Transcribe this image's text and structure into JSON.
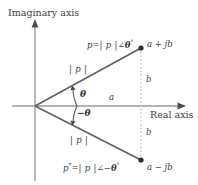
{
  "figure": {
    "background_color": "#ffffff",
    "line_color": "#6e6e6e",
    "text_color": "#3a3a3a"
  },
  "axes": {
    "imaginary_label": "Imaginary axis",
    "real_label": "Real axis",
    "origin": {
      "x": 35,
      "y": 106
    }
  },
  "labels": {
    "point_upper_expr_lhs": "p",
    "point_upper_expr_eq": "=",
    "point_upper_expr_mag": "| p |",
    "point_upper_expr_angle": "∠",
    "point_upper_expr_theta": "θ",
    "point_upper_expr_deg": "°",
    "point_upper_cartesian": "a + jb",
    "point_lower_expr_lhs": "p",
    "point_lower_expr_star": "*",
    "point_lower_expr_eq": "=",
    "point_lower_expr_mag": "| p |",
    "point_lower_expr_angle": "∠",
    "point_lower_expr_minus": "−",
    "point_lower_expr_theta": "θ",
    "point_lower_expr_deg": "°",
    "point_lower_cartesian": "a − jb",
    "magnitude_upper": "| p |",
    "magnitude_lower": "| p |",
    "angle_upper": "θ",
    "angle_lower": "−θ",
    "real_component": "a",
    "imag_component_upper": "b",
    "imag_component_lower": "b"
  },
  "geometry": {
    "point_upper": {
      "x": 141,
      "y": 48
    },
    "point_lower": {
      "x": 141,
      "y": 160
    },
    "real_axis_end": {
      "x": 186,
      "y": 106
    },
    "imag_axis_top": {
      "x": 35,
      "y": 20
    },
    "imag_axis_bottom": {
      "x": 35,
      "y": 181
    }
  }
}
